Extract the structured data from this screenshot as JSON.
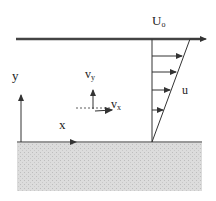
{
  "diagram": {
    "labels": {
      "plate_velocity": "U",
      "plate_velocity_sub": "o",
      "y_axis": "y",
      "x_axis": "x",
      "vy": "v",
      "vy_sub": "y",
      "vx": "v",
      "vx_sub": "x",
      "u": "u"
    },
    "colors": {
      "line": "#333333",
      "plate": "#444444",
      "ground_fill": "#d8d8d8"
    },
    "profile_arrows": 4
  }
}
